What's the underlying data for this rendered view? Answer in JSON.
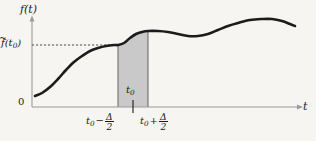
{
  "figure": {
    "kind": "function-plot-with-shaded-window",
    "background_color": "#f7f5f1",
    "curve_color": "#1b1b1b",
    "axis_color": "#9a9a9a",
    "shade_color": "#c9c9c9",
    "dashed_color": "#4d4d4d"
  },
  "labels": {
    "y_axis_title_f": "f",
    "y_axis_title_arg": "(t)",
    "x_axis_title": "t",
    "origin": "0",
    "y_tick_f": "f",
    "y_tick_accent": "~",
    "y_tick_arg": "(t",
    "y_tick_sub": "0",
    "y_tick_close": ")",
    "center_t": "t",
    "center_sub": "0",
    "left_bound_t": "t",
    "left_bound_sub": "0",
    "left_bound_op": "−",
    "left_bound_num": "Δ",
    "left_bound_den": "2",
    "right_bound_t": "t",
    "right_bound_sub": "0",
    "right_bound_op": "+",
    "right_bound_num": "Δ",
    "right_bound_den": "2"
  },
  "chart_data": {
    "type": "line",
    "title": "",
    "xlabel": "t",
    "ylabel": "f(t)",
    "grid": false,
    "legend": null,
    "axis_pixel_origin": {
      "x": 32,
      "y": 107
    },
    "x_axis_arrow_end": 303,
    "y_axis_arrow_end": 16,
    "xlim_px": [
      32,
      303
    ],
    "ylim_px": [
      107,
      16
    ],
    "curve_points_px": [
      [
        35,
        96
      ],
      [
        42,
        93
      ],
      [
        50,
        87
      ],
      [
        58,
        79
      ],
      [
        66,
        70
      ],
      [
        74,
        62
      ],
      [
        82,
        56
      ],
      [
        90,
        51
      ],
      [
        98,
        48
      ],
      [
        106,
        46
      ],
      [
        114,
        45
      ],
      [
        118,
        45
      ],
      [
        124,
        43
      ],
      [
        130,
        38
      ],
      [
        136,
        34
      ],
      [
        142,
        32
      ],
      [
        148,
        31
      ],
      [
        158,
        31
      ],
      [
        168,
        32
      ],
      [
        178,
        34
      ],
      [
        188,
        36
      ],
      [
        198,
        36
      ],
      [
        208,
        34
      ],
      [
        218,
        30
      ],
      [
        228,
        26
      ],
      [
        238,
        23
      ],
      [
        250,
        20
      ],
      [
        262,
        19
      ],
      [
        272,
        19
      ],
      [
        282,
        21
      ],
      [
        290,
        24
      ],
      [
        295,
        26
      ]
    ],
    "shaded_window": {
      "x_left_px": 118,
      "x_right_px": 148,
      "baseline_y_px": 107,
      "label": "t0",
      "fill": "#c9c9c9",
      "edge": "#555555"
    },
    "dashed_level": {
      "y_px": 45,
      "x_from_px": 32,
      "x_to_px": 118,
      "value_label": "f~(t0)"
    },
    "center_tick": {
      "x_px": 133,
      "y_top_px": 100,
      "y_bottom_px": 113
    },
    "annotations": [
      "f(t)",
      "f~(t0)",
      "t0",
      "t0 - delta/2",
      "t0 + delta/2",
      "0",
      "t"
    ]
  }
}
